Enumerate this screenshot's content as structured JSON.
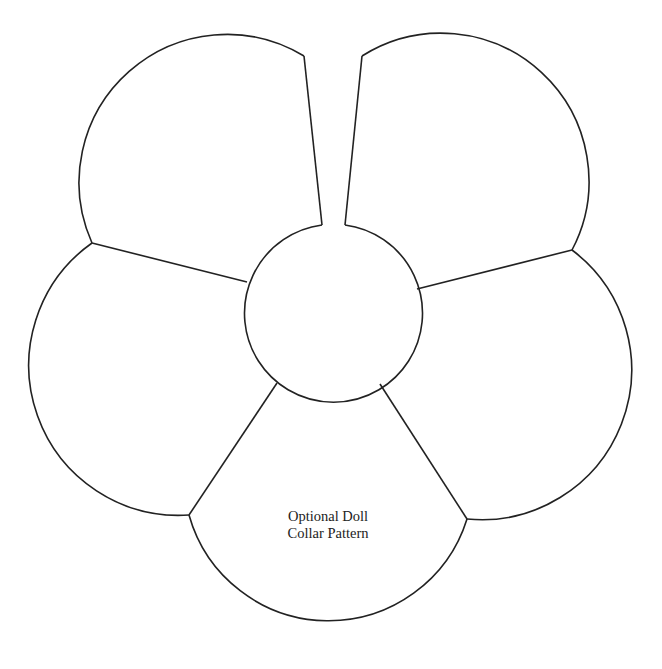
{
  "diagram": {
    "title": "Optional Doll Collar Pattern",
    "label_lines": [
      "Optional Doll",
      "Collar Pattern"
    ],
    "shape": "five-petal flower collar with central neck opening and front slit",
    "center_circle": {
      "cx": 332,
      "cy": 312,
      "r": 89
    },
    "petals": [
      {
        "name": "top-left",
        "outer_points": [
          [
            304,
            56
          ],
          [
            225,
            33
          ],
          [
            92,
            243
          ]
        ]
      },
      {
        "name": "left",
        "outer_points": [
          [
            92,
            243
          ],
          [
            35,
            362
          ],
          [
            189,
            515
          ]
        ]
      },
      {
        "name": "bottom",
        "outer_points": [
          [
            189,
            515
          ],
          [
            330,
            624
          ],
          [
            467,
            519
          ]
        ]
      },
      {
        "name": "right",
        "outer_points": [
          [
            467,
            519
          ],
          [
            627,
            370
          ],
          [
            572,
            250
          ]
        ]
      },
      {
        "name": "top-right",
        "outer_points": [
          [
            572,
            250
          ],
          [
            440,
            34
          ],
          [
            362,
            56
          ]
        ]
      }
    ],
    "line_color": "#222222",
    "background_color": "#ffffff"
  }
}
